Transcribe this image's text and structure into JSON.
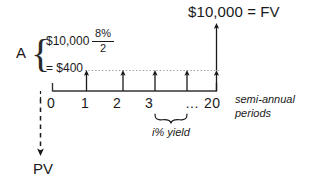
{
  "diagram": {
    "title_right": "$10,000 = FV",
    "annuity_symbol": "A",
    "annuity_principal": "$10,000",
    "rate_numerator": "8%",
    "rate_denominator": "2",
    "annuity_payment": "= $400",
    "axis_label": "semi-annual",
    "axis_label_2": "periods",
    "yield_label": "i% yield",
    "pv_label": "PV",
    "ellipsis_and_last": "… 20",
    "tick_labels": [
      "0",
      "1",
      "2",
      "3"
    ],
    "colors": {
      "ink": "#1a1a1a",
      "line": "#333333",
      "dotted": "#9a9a9a",
      "background": "#ffffff"
    }
  }
}
